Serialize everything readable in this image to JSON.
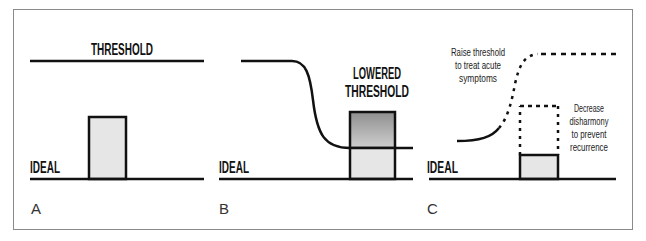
{
  "figure": {
    "panels": [
      {
        "letter": "A",
        "threshold_label": "THRESHOLD",
        "ideal_label": "IDEAL"
      },
      {
        "letter": "B",
        "threshold_label_line1": "LOWERED",
        "threshold_label_line2": "THRESHOLD",
        "ideal_label": "IDEAL"
      },
      {
        "letter": "C",
        "ideal_label": "IDEAL",
        "annotation_raise": [
          "Raise threshold",
          "to treat acute",
          "symptoms"
        ],
        "annotation_decrease": [
          "Decrease",
          "disharmony",
          "to prevent",
          "recurrence"
        ]
      }
    ],
    "colors": {
      "line": "#111111",
      "box_fill_light": "#e6e6e6",
      "box_fill_dark_top": "#9a9a9a",
      "box_fill_dark_bottom": "#c8c8c8",
      "frame": "#8a8a8a"
    }
  }
}
